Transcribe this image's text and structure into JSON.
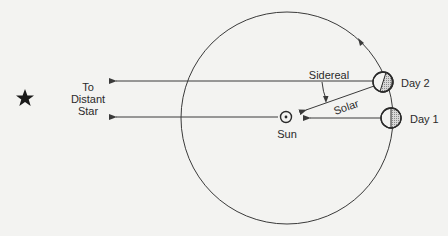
{
  "diagram": {
    "type": "sidereal-vs-solar-day",
    "labels": {
      "star_line1": "To",
      "star_line2": "Distant",
      "star_line3": "Star",
      "sidereal": "Sidereal",
      "solar": "Solar",
      "sun": "Sun",
      "day2": "Day 2",
      "day1": "Day 1"
    },
    "icons": {
      "star": "star-icon",
      "sun": "sun-symbol-icon",
      "earth": "earth-icon"
    },
    "colors": {
      "line": "#3a3a3a",
      "shade": "#b8b8b8",
      "background": "#f3f3f1"
    }
  }
}
